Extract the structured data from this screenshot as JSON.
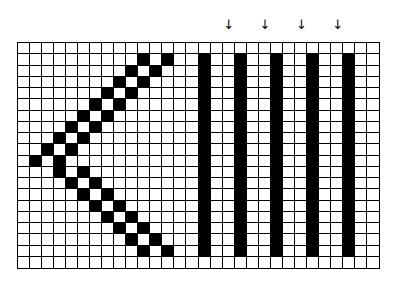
{
  "diagram": {
    "grid": {
      "cols": 30,
      "rows": 20,
      "left": 17,
      "top": 42,
      "width": 363,
      "height": 227,
      "cell_color": "#ffffff",
      "fill_color": "#000000",
      "line_color": "#000000"
    },
    "chevron": {
      "description": "double-line left-pointing chevron",
      "upper_arm": [
        [
          1,
          10
        ],
        [
          1,
          12
        ],
        [
          2,
          9
        ],
        [
          2,
          11
        ],
        [
          3,
          8
        ],
        [
          3,
          10
        ],
        [
          4,
          7
        ],
        [
          4,
          9
        ],
        [
          5,
          6
        ],
        [
          5,
          8
        ],
        [
          6,
          5
        ],
        [
          6,
          7
        ],
        [
          7,
          4
        ],
        [
          7,
          6
        ],
        [
          8,
          3
        ],
        [
          8,
          5
        ],
        [
          9,
          2
        ],
        [
          9,
          4
        ]
      ],
      "apex": [
        [
          10,
          1
        ],
        [
          10,
          3
        ]
      ],
      "lower_arm": [
        [
          11,
          3
        ],
        [
          11,
          5
        ],
        [
          12,
          4
        ],
        [
          12,
          6
        ],
        [
          13,
          5
        ],
        [
          13,
          7
        ],
        [
          14,
          6
        ],
        [
          14,
          8
        ],
        [
          15,
          7
        ],
        [
          15,
          9
        ],
        [
          16,
          8
        ],
        [
          16,
          10
        ],
        [
          17,
          9
        ],
        [
          17,
          11
        ],
        [
          18,
          10
        ],
        [
          18,
          12
        ]
      ]
    },
    "bars": {
      "description": "vertical black bars",
      "columns": [
        15,
        18,
        21,
        24,
        27
      ],
      "row_start": 1,
      "row_end": 18
    },
    "arrows": {
      "glyph": "↓",
      "columns": [
        17,
        20,
        23,
        26
      ]
    }
  }
}
